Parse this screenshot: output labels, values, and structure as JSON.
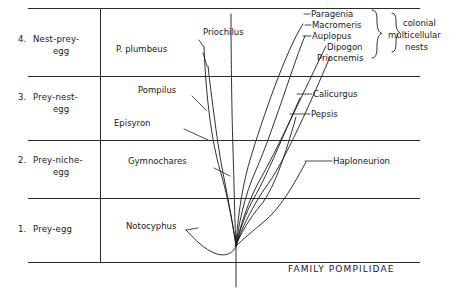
{
  "figure": {
    "family_caption": "FAMILY POMPILIDAE",
    "stages": [
      {
        "number": "4.",
        "line1": "Nest-prey-",
        "line2": "egg"
      },
      {
        "number": "3.",
        "line1": "Prey-nest-",
        "line2": "egg"
      },
      {
        "number": "2.",
        "line1": "Prey-niche-",
        "line2": "egg"
      },
      {
        "number": "1.",
        "line1": "Prey-egg",
        "line2": ""
      }
    ],
    "genera": [
      {
        "name": "Paragenia"
      },
      {
        "name": "Macromeris"
      },
      {
        "name": "Auplopus"
      },
      {
        "name": "Dipogon"
      },
      {
        "name": "Priocnemis"
      },
      {
        "name": "Priochilus"
      },
      {
        "name": "P. plumbeus"
      },
      {
        "name": "Calicurgus"
      },
      {
        "name": "Pepsis"
      },
      {
        "name": "Pompilus"
      },
      {
        "name": "Episyron"
      },
      {
        "name": "Gymnochares"
      },
      {
        "name": "Haploneurion"
      },
      {
        "name": "Notocyphus"
      }
    ],
    "annotation": {
      "line1": "colonial",
      "line2": "multicellular",
      "line3": "nests"
    },
    "colors": {
      "ink": "#1a1a1a",
      "rule": "#2b2b2b",
      "background": "#ffffff"
    }
  }
}
